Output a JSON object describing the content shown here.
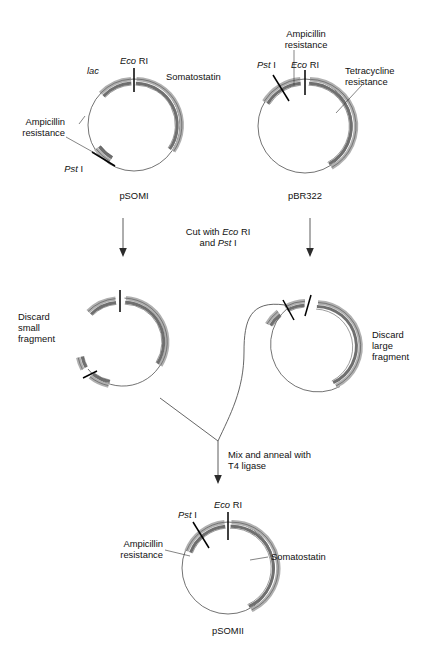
{
  "figure": {
    "background": "#ffffff",
    "colors": {
      "arc_outer_band": "#b0b0b0",
      "arc_inner_band": "#6f6f6f",
      "arc_edge": "#3a3a3a",
      "backbone_line": "#444444",
      "text": "#111111",
      "leader_line": "#333333",
      "arrow": "#2b2b2b"
    }
  },
  "enzymes": {
    "eco": {
      "italic": "Eco",
      "roman": " RI"
    },
    "pst": {
      "italic": "Pst",
      "roman": " I"
    }
  },
  "plasmids": {
    "psomi": {
      "name": "pSOMI",
      "labels": {
        "lac": "lac",
        "somatostatin": "Somatostatin",
        "ampicillin_line1": "Ampicillin",
        "ampicillin_line2": "resistance"
      },
      "sites": [
        {
          "name": "Eco RI",
          "italic": "Eco",
          "roman": " RI"
        },
        {
          "name": "Pst I",
          "italic": "Pst",
          "roman": " I"
        }
      ]
    },
    "pbr322": {
      "name": "pBR322",
      "labels": {
        "ampicillin_line1": "Ampicillin",
        "ampicillin_line2": "resistance",
        "tetracycline_line1": "Tetracycline",
        "tetracycline_line2": "resistance"
      },
      "sites": [
        {
          "name": "Pst I",
          "italic": "Pst",
          "roman": " I"
        },
        {
          "name": "Eco RI",
          "italic": "Eco",
          "roman": " RI"
        }
      ]
    },
    "cut_left": {
      "discard_line1": "Discard",
      "discard_line2": "small",
      "discard_line3": "fragment"
    },
    "cut_right": {
      "discard_line1": "Discard",
      "discard_line2": "large",
      "discard_line3": "fragment"
    },
    "psomii": {
      "name": "pSOMII",
      "labels": {
        "somatostatin": "Somatostatin",
        "ampicillin_line1": "Ampicillin",
        "ampicillin_line2": "resistance"
      },
      "sites": [
        {
          "name": "Eco RI",
          "italic": "Eco",
          "roman": " RI"
        },
        {
          "name": "Pst I",
          "italic": "Pst",
          "roman": " I"
        }
      ]
    }
  },
  "steps": {
    "cut": {
      "line1_pre": "Cut with ",
      "line1_italic": "Eco",
      "line1_post": " RI",
      "line2_pre": "and ",
      "line2_italic": "Pst",
      "line2_post": " I"
    },
    "ligate": {
      "line1": "Mix and anneal with",
      "line2": "T4 ligase"
    }
  }
}
